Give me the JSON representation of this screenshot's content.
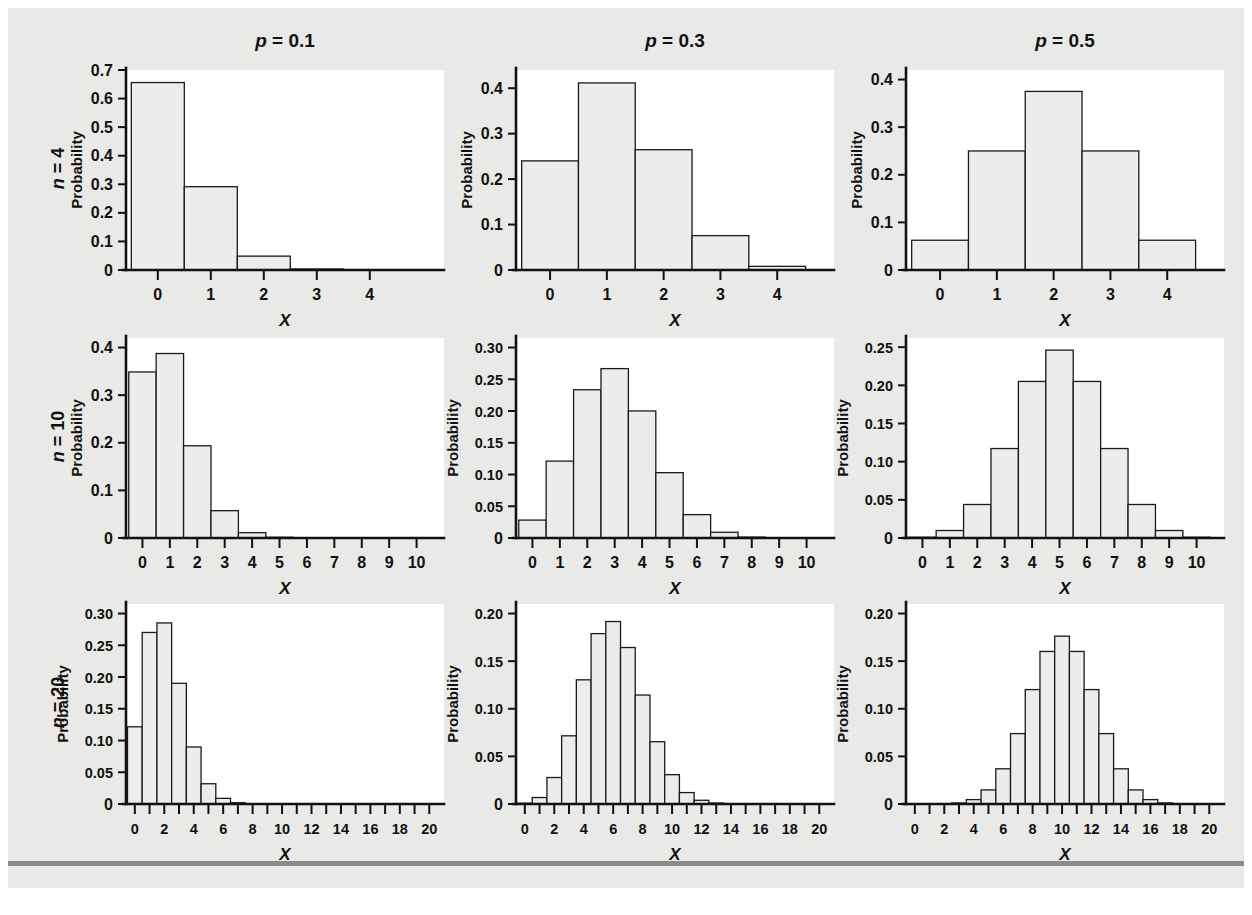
{
  "figure": {
    "background_color": "#e9e9e7",
    "bar_fill_color": "#ececea",
    "bar_stroke_color": "#1a1a1a",
    "axis_color": "#111111",
    "plot_area_color": "#ffffff",
    "footer_rule_color": "#8b8b8b"
  },
  "column_titles": [
    {
      "prefix": "p",
      "rest": " = 0.1",
      "full": "p = 0.1"
    },
    {
      "prefix": "p",
      "rest": " = 0.3",
      "full": "p = 0.3"
    },
    {
      "prefix": "p",
      "rest": " = 0.5",
      "full": "p = 0.5"
    }
  ],
  "row_labels": [
    {
      "prefix": "n",
      "rest": " = 4",
      "full": "n = 4"
    },
    {
      "prefix": "n",
      "rest": " = 10",
      "full": "n = 10"
    },
    {
      "prefix": "n",
      "rest": " = 20",
      "full": "n = 20"
    }
  ],
  "axis_titles": {
    "x": "X",
    "y": "Probability"
  },
  "chart_data": [
    {
      "type": "bar",
      "title": "p = 0.1",
      "row_label": "n = 4",
      "n": 4,
      "p": 0.1,
      "xlabel": "X",
      "ylabel": "Probability",
      "categories": [
        0,
        1,
        2,
        3,
        4
      ],
      "values": [
        0.6561,
        0.2916,
        0.0486,
        0.0036,
        0.0001
      ],
      "ylim": [
        0,
        0.7
      ],
      "yticks": [
        0,
        0.1,
        0.2,
        0.3,
        0.4,
        0.5,
        0.6,
        0.7
      ],
      "ytick_labels": [
        "0",
        "0.1",
        "0.2",
        "0.3",
        "0.4",
        "0.5",
        "0.6",
        "0.7"
      ],
      "xticks": [
        0,
        1,
        2,
        3,
        4
      ],
      "xtick_labels": [
        "0",
        "1",
        "2",
        "3",
        "4"
      ],
      "xlim": [
        -0.6,
        5.4
      ],
      "grid": false,
      "legend": "none"
    },
    {
      "type": "bar",
      "title": "p = 0.3",
      "row_label": "n = 4",
      "n": 4,
      "p": 0.3,
      "xlabel": "X",
      "ylabel": "Probability",
      "categories": [
        0,
        1,
        2,
        3,
        4
      ],
      "values": [
        0.2401,
        0.4116,
        0.2646,
        0.0756,
        0.0081
      ],
      "ylim": [
        0,
        0.44
      ],
      "yticks": [
        0,
        0.1,
        0.2,
        0.3,
        0.4
      ],
      "ytick_labels": [
        "0",
        "0.1",
        "0.2",
        "0.3",
        "0.4"
      ],
      "xticks": [
        0,
        1,
        2,
        3,
        4
      ],
      "xtick_labels": [
        "0",
        "1",
        "2",
        "3",
        "4"
      ],
      "xlim": [
        -0.6,
        5.0
      ],
      "grid": false,
      "legend": "none"
    },
    {
      "type": "bar",
      "title": "p = 0.5",
      "row_label": "n = 4",
      "n": 4,
      "p": 0.5,
      "xlabel": "X",
      "ylabel": "Probability",
      "categories": [
        0,
        1,
        2,
        3,
        4
      ],
      "values": [
        0.0625,
        0.25,
        0.375,
        0.25,
        0.0625
      ],
      "ylim": [
        0,
        0.42
      ],
      "yticks": [
        0,
        0.1,
        0.2,
        0.3,
        0.4
      ],
      "ytick_labels": [
        "0",
        "0.1",
        "0.2",
        "0.3",
        "0.4"
      ],
      "xticks": [
        0,
        1,
        2,
        3,
        4
      ],
      "xtick_labels": [
        "0",
        "1",
        "2",
        "3",
        "4"
      ],
      "xlim": [
        -0.6,
        5.0
      ],
      "grid": false,
      "legend": "none"
    },
    {
      "type": "bar",
      "title": "p = 0.1",
      "row_label": "n = 10",
      "n": 10,
      "p": 0.1,
      "xlabel": "X",
      "ylabel": "Probability",
      "categories": [
        0,
        1,
        2,
        3,
        4,
        5,
        6,
        7,
        8,
        9,
        10
      ],
      "values": [
        0.3487,
        0.3874,
        0.1937,
        0.0574,
        0.0112,
        0.0015,
        0.0001,
        0.0,
        0.0,
        0.0,
        0.0
      ],
      "ylim": [
        0,
        0.42
      ],
      "yticks": [
        0,
        0.1,
        0.2,
        0.3,
        0.4
      ],
      "ytick_labels": [
        "0",
        "0.1",
        "0.2",
        "0.3",
        "0.4"
      ],
      "xticks": [
        0,
        1,
        2,
        3,
        4,
        5,
        6,
        7,
        8,
        9,
        10
      ],
      "xtick_labels": [
        "0",
        "1",
        "2",
        "3",
        "4",
        "5",
        "6",
        "7",
        "8",
        "9",
        "10"
      ],
      "xlim": [
        -0.6,
        11.0
      ],
      "grid": false,
      "legend": "none"
    },
    {
      "type": "bar",
      "title": "p = 0.3",
      "row_label": "n = 10",
      "n": 10,
      "p": 0.3,
      "xlabel": "X",
      "ylabel": "Probability",
      "categories": [
        0,
        1,
        2,
        3,
        4,
        5,
        6,
        7,
        8,
        9,
        10
      ],
      "values": [
        0.0282,
        0.1211,
        0.2335,
        0.2668,
        0.2001,
        0.1029,
        0.0368,
        0.009,
        0.0014,
        0.0001,
        0.0
      ],
      "ylim": [
        0,
        0.315
      ],
      "yticks": [
        0,
        0.05,
        0.1,
        0.15,
        0.2,
        0.25,
        0.3
      ],
      "ytick_labels": [
        "0",
        "0.05",
        "0.10",
        "0.15",
        "0.20",
        "0.25",
        "0.30"
      ],
      "xticks": [
        0,
        1,
        2,
        3,
        4,
        5,
        6,
        7,
        8,
        9,
        10
      ],
      "xtick_labels": [
        "0",
        "1",
        "2",
        "3",
        "4",
        "5",
        "6",
        "7",
        "8",
        "9",
        "10"
      ],
      "xlim": [
        -0.6,
        11.0
      ],
      "grid": false,
      "legend": "none"
    },
    {
      "type": "bar",
      "title": "p = 0.5",
      "row_label": "n = 10",
      "n": 10,
      "p": 0.5,
      "xlabel": "X",
      "ylabel": "Probability",
      "categories": [
        0,
        1,
        2,
        3,
        4,
        5,
        6,
        7,
        8,
        9,
        10
      ],
      "values": [
        0.001,
        0.0098,
        0.0439,
        0.1172,
        0.2051,
        0.2461,
        0.2051,
        0.1172,
        0.0439,
        0.0098,
        0.001
      ],
      "ylim": [
        0,
        0.262
      ],
      "yticks": [
        0,
        0.05,
        0.1,
        0.15,
        0.2,
        0.25
      ],
      "ytick_labels": [
        "0",
        "0.05",
        "0.10",
        "0.15",
        "0.20",
        "0.25"
      ],
      "xticks": [
        0,
        1,
        2,
        3,
        4,
        5,
        6,
        7,
        8,
        9,
        10
      ],
      "xtick_labels": [
        "0",
        "1",
        "2",
        "3",
        "4",
        "5",
        "6",
        "7",
        "8",
        "9",
        "10"
      ],
      "xlim": [
        -0.6,
        11.0
      ],
      "grid": false,
      "legend": "none"
    },
    {
      "type": "bar",
      "title": "p = 0.1",
      "row_label": "n = 20",
      "n": 20,
      "p": 0.1,
      "xlabel": "X",
      "ylabel": "Probability",
      "categories": [
        0,
        1,
        2,
        3,
        4,
        5,
        6,
        7,
        8,
        9,
        10,
        11,
        12,
        13,
        14,
        15,
        16,
        17,
        18,
        19,
        20
      ],
      "values": [
        0.1216,
        0.2702,
        0.2852,
        0.1901,
        0.0898,
        0.0319,
        0.0089,
        0.002,
        0.0004,
        0.0001,
        0.0,
        0.0,
        0.0,
        0.0,
        0.0,
        0.0,
        0.0,
        0.0,
        0.0,
        0.0,
        0.0
      ],
      "ylim": [
        0,
        0.315
      ],
      "yticks": [
        0,
        0.05,
        0.1,
        0.15,
        0.2,
        0.25,
        0.3
      ],
      "ytick_labels": [
        "0",
        "0.05",
        "0.10",
        "0.15",
        "0.20",
        "0.25",
        "0.30"
      ],
      "xticks": [
        0,
        1,
        2,
        3,
        4,
        5,
        6,
        7,
        8,
        9,
        10,
        11,
        12,
        13,
        14,
        15,
        16,
        17,
        18,
        19,
        20
      ],
      "xtick_labels": [
        "0",
        "",
        "2",
        "",
        "4",
        "",
        "6",
        "",
        "8",
        "",
        "10",
        "",
        "12",
        "",
        "14",
        "",
        "16",
        "",
        "18",
        "",
        "20"
      ],
      "xlim": [
        -0.6,
        21.0
      ],
      "grid": false,
      "legend": "none"
    },
    {
      "type": "bar",
      "title": "p = 0.3",
      "row_label": "n = 20",
      "n": 20,
      "p": 0.3,
      "xlabel": "X",
      "ylabel": "Probability",
      "categories": [
        0,
        1,
        2,
        3,
        4,
        5,
        6,
        7,
        8,
        9,
        10,
        11,
        12,
        13,
        14,
        15,
        16,
        17,
        18,
        19,
        20
      ],
      "values": [
        0.0008,
        0.0068,
        0.0278,
        0.0716,
        0.1304,
        0.1789,
        0.1916,
        0.1643,
        0.1144,
        0.0654,
        0.0308,
        0.012,
        0.0039,
        0.001,
        0.0002,
        0.0,
        0.0,
        0.0,
        0.0,
        0.0,
        0.0
      ],
      "ylim": [
        0,
        0.21
      ],
      "yticks": [
        0,
        0.05,
        0.1,
        0.15,
        0.2
      ],
      "ytick_labels": [
        "0",
        "0.05",
        "0.10",
        "0.15",
        "0.20"
      ],
      "xticks": [
        0,
        1,
        2,
        3,
        4,
        5,
        6,
        7,
        8,
        9,
        10,
        11,
        12,
        13,
        14,
        15,
        16,
        17,
        18,
        19,
        20
      ],
      "xtick_labels": [
        "0",
        "",
        "2",
        "",
        "4",
        "",
        "6",
        "",
        "8",
        "",
        "10",
        "",
        "12",
        "",
        "14",
        "",
        "16",
        "",
        "18",
        "",
        "20"
      ],
      "xlim": [
        -0.6,
        21.0
      ],
      "grid": false,
      "legend": "none"
    },
    {
      "type": "bar",
      "title": "p = 0.5",
      "row_label": "n = 20",
      "n": 20,
      "p": 0.5,
      "xlabel": "X",
      "ylabel": "Probability",
      "categories": [
        0,
        1,
        2,
        3,
        4,
        5,
        6,
        7,
        8,
        9,
        10,
        11,
        12,
        13,
        14,
        15,
        16,
        17,
        18,
        19,
        20
      ],
      "values": [
        0.0,
        0.0,
        0.0002,
        0.0011,
        0.0046,
        0.0148,
        0.037,
        0.0739,
        0.012,
        0.1602,
        0.1762,
        0.1602,
        0.012,
        0.0739,
        0.037,
        0.0148,
        0.0046,
        0.0011,
        0.0002,
        0.0,
        0.0
      ],
      "values_exact": [
        1e-06,
        1.9e-05,
        0.000181,
        0.001087,
        0.004621,
        0.014786,
        0.036964,
        0.073929,
        0.120134,
        0.160179,
        0.176197,
        0.160179,
        0.120134,
        0.073929,
        0.036964,
        0.014786,
        0.004621,
        0.001087,
        0.000181,
        1.9e-05,
        1e-06
      ],
      "ylim": [
        0,
        0.21
      ],
      "yticks": [
        0,
        0.05,
        0.1,
        0.15,
        0.2
      ],
      "ytick_labels": [
        "0",
        "0.05",
        "0.10",
        "0.15",
        "0.20"
      ],
      "xticks": [
        0,
        1,
        2,
        3,
        4,
        5,
        6,
        7,
        8,
        9,
        10,
        11,
        12,
        13,
        14,
        15,
        16,
        17,
        18,
        19,
        20
      ],
      "xtick_labels": [
        "0",
        "",
        "2",
        "",
        "4",
        "",
        "6",
        "",
        "8",
        "",
        "10",
        "",
        "12",
        "",
        "14",
        "",
        "16",
        "",
        "18",
        "",
        "20"
      ],
      "xlim": [
        -0.6,
        21.0
      ],
      "grid": false,
      "legend": "none"
    }
  ]
}
